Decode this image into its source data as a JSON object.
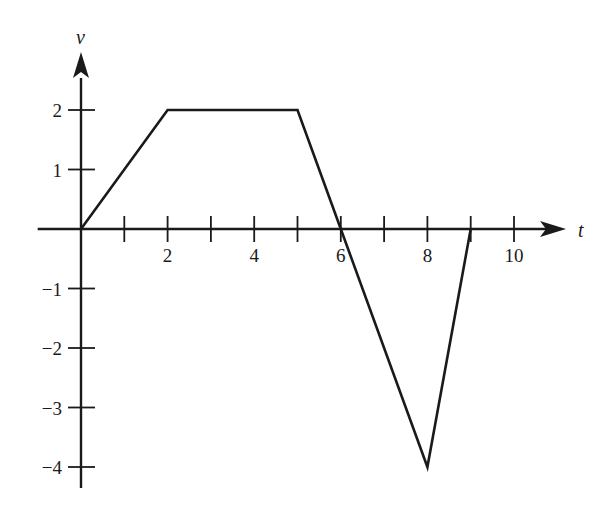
{
  "chart_data": {
    "type": "line",
    "title": "",
    "xlabel": "t",
    "ylabel": "v",
    "x": [
      0,
      2,
      5,
      6,
      8,
      9
    ],
    "series": [
      {
        "name": "v(t)",
        "values": [
          0,
          2,
          2,
          0,
          -4,
          0
        ]
      }
    ],
    "xticks": [
      1,
      2,
      3,
      4,
      5,
      6,
      7,
      8,
      9,
      10
    ],
    "xtick_labels": [
      "2",
      "4",
      "6",
      "8",
      "10"
    ],
    "xtick_label_values": [
      2,
      4,
      6,
      8,
      10
    ],
    "yticks": [
      2,
      1,
      -1,
      -2,
      -3,
      -4
    ],
    "ytick_labels": [
      "2",
      "1",
      "−1",
      "−2",
      "−3",
      "−4"
    ],
    "xlim": [
      -1,
      11.5
    ],
    "ylim": [
      -4.4,
      2.8
    ],
    "grid": false,
    "legend": null
  },
  "layout": {
    "origin_px": [
      81,
      229
    ],
    "x_unit_px": 43.3,
    "y_unit_px": 59.5,
    "line_color": "#1a1a1a"
  }
}
